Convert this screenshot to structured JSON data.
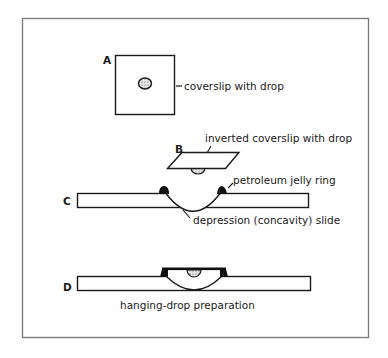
{
  "figure": {
    "panels": [
      {
        "id": "A",
        "letter": "A",
        "label": "coverslip with drop"
      },
      {
        "id": "B",
        "letter": "B",
        "label": "inverted coverslip with drop"
      },
      {
        "id": "C",
        "letter": "C",
        "labels": [
          "petroleum jelly ring",
          "depression (concavity) slide"
        ]
      },
      {
        "id": "D",
        "letter": "D",
        "label": "hanging-drop preparation"
      }
    ]
  },
  "colors": {
    "ink": "#1a1a1a",
    "frame": "#777777",
    "drop_fill": "#d8d8d8"
  }
}
